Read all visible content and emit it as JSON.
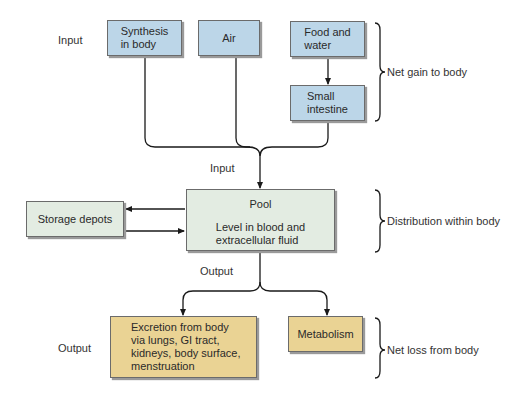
{
  "diagram": {
    "type": "flowchart",
    "theme_colors": {
      "input_box": "#bcd6e8",
      "pool_box": "#e3ece2",
      "output_box": "#ead394",
      "line": "#1a1a1a"
    },
    "side_labels": {
      "input_top": "Input",
      "input_center": "Input",
      "output_center": "Output",
      "output_bottom": "Output"
    },
    "boxes": {
      "synthesis": "Synthesis\nin body",
      "air": "Air",
      "food_water": "Food and\nwater",
      "small_intestine": "Small\nintestine",
      "pool_title": "Pool",
      "pool_detail": "Level in blood and\nextracellular fluid",
      "storage": "Storage depots",
      "excretion": "Excretion from body\nvia lungs, GI tract,\nkidneys, body surface,\nmenstruation",
      "metabolism": "Metabolism"
    },
    "braces": {
      "gain": "Net gain to body",
      "distribution": "Distribution within body",
      "loss": "Net loss from body"
    }
  }
}
